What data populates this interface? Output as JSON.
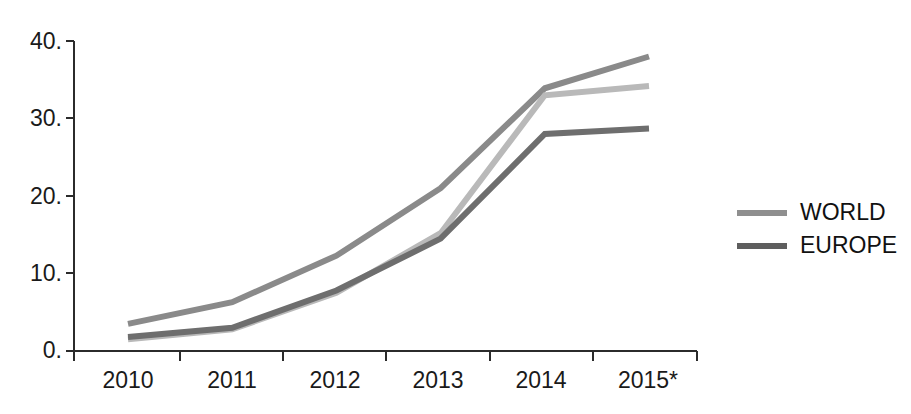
{
  "chart_data": {
    "type": "line",
    "title": "",
    "subtitle": "",
    "xlabel": "",
    "ylabel": "",
    "categories": [
      "2010",
      "2011",
      "2012",
      "2013",
      "2014",
      "2015*"
    ],
    "x_tick_labels": [
      "2010",
      "2011",
      "2012",
      "2013",
      "2014",
      "2015*"
    ],
    "y_tick_labels": [
      "0.",
      "10.",
      "20.",
      "30.",
      "40."
    ],
    "y_tick_values": [
      0,
      10,
      20,
      30,
      40
    ],
    "ylim": [
      0,
      40
    ],
    "grid": false,
    "legend_position": "right",
    "series": [
      {
        "name": "WORLD",
        "color": "#b9b9b9",
        "legend_label": "WORLD",
        "values": [
          1.5,
          2.8,
          7.5,
          15.2,
          33.0,
          34.2
        ]
      },
      {
        "name": "EUROPE",
        "color": "#6e6e6e",
        "legend_label": "EUROPE",
        "values": [
          1.8,
          3.0,
          7.8,
          14.5,
          28.0,
          28.7
        ]
      },
      {
        "name": "UPPER",
        "color": "#8a8a8a",
        "legend_label": "",
        "values": [
          3.5,
          6.3,
          12.3,
          21.0,
          33.9,
          38.0
        ]
      }
    ]
  },
  "legend": {
    "entries": [
      {
        "label": "WORLD",
        "color": "#8f8f8f"
      },
      {
        "label": "EUROPE",
        "color": "#5e5e5e"
      }
    ]
  },
  "axes": {
    "y_labels": [
      "40.",
      "30.",
      "20.",
      "10.",
      "0."
    ],
    "x_labels": [
      "2010",
      "2011",
      "2012",
      "2013",
      "2014",
      "2015*"
    ],
    "axis_color": "#2b2b2b"
  },
  "colors": {
    "background": "#ffffff",
    "axis": "#2b2b2b",
    "text": "#1a1a1a",
    "series_light": "#b9b9b9",
    "series_mid": "#8a8a8a",
    "series_dark": "#6e6e6e"
  }
}
